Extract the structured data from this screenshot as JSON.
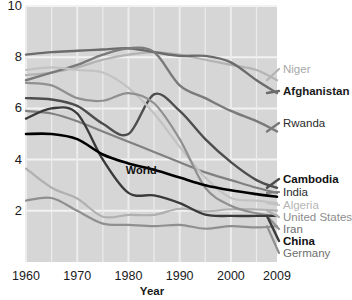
{
  "chart_data": {
    "type": "line",
    "title": "",
    "xlabel": "Year",
    "ylabel": "",
    "xlim": [
      1960,
      2009
    ],
    "ylim": [
      0,
      10
    ],
    "grid": true,
    "legend_position": "right-of-plot",
    "xticks": [
      "1960",
      "1970",
      "1980",
      "1990",
      "2000",
      "2009"
    ],
    "xtick_values": [
      1960,
      1970,
      1980,
      1990,
      2000,
      2009
    ],
    "yticks": [
      "2",
      "4",
      "6",
      "8",
      "10"
    ],
    "ytick_values": [
      2,
      4,
      6,
      8,
      10
    ],
    "x": [
      1960,
      1965,
      1970,
      1975,
      1980,
      1985,
      1990,
      1995,
      2000,
      2005,
      2009
    ],
    "annotations": [
      {
        "text": "World",
        "x": 1983,
        "y": 3.6
      }
    ],
    "series": [
      {
        "name": "Niger",
        "label": "Niger",
        "color": "#b3b3b3",
        "width": 2.2,
        "label_weight": "normal",
        "label_color": "#a8a8a8",
        "label_y": 73,
        "values": [
          7.3,
          7.4,
          7.6,
          7.9,
          8.1,
          8.2,
          8.1,
          7.9,
          7.7,
          7.5,
          7.1
        ]
      },
      {
        "name": "Afghanistan",
        "label": "Afghanistan",
        "color": "#6b6b6b",
        "width": 2.4,
        "label_weight": "bold",
        "label_color": "#1a1a1a",
        "label_y": 95,
        "values": [
          8.1,
          8.2,
          8.25,
          8.3,
          8.35,
          8.2,
          8.05,
          8.05,
          7.8,
          7.1,
          6.6
        ]
      },
      {
        "name": "Rwanda",
        "label": "Rwanda",
        "color": "#7a7a7a",
        "width": 2.4,
        "label_weight": "normal",
        "label_color": "#2a2a2a",
        "label_y": 127,
        "values": [
          7.1,
          7.4,
          7.7,
          8.1,
          8.35,
          8.2,
          6.9,
          6.4,
          5.9,
          5.5,
          5.1
        ]
      },
      {
        "name": "Cambodia",
        "label": "Cambodia",
        "color": "#4d4d4d",
        "width": 2.4,
        "label_weight": "bold",
        "label_color": "#111111",
        "label_y": 183,
        "values": [
          6.4,
          6.35,
          6.1,
          5.4,
          5.0,
          6.55,
          5.9,
          4.8,
          3.9,
          3.2,
          2.9
        ]
      },
      {
        "name": "India",
        "label": "India",
        "color": "#808080",
        "width": 2.2,
        "label_weight": "normal",
        "label_color": "#2a2a2a",
        "label_y": 196,
        "values": [
          5.9,
          5.8,
          5.5,
          5.1,
          4.7,
          4.3,
          3.9,
          3.5,
          3.2,
          2.9,
          2.7
        ]
      },
      {
        "name": "Algeria",
        "label": "Algeria",
        "color": "#c2c2c2",
        "width": 2.2,
        "label_weight": "normal",
        "label_color": "#b5b5b5",
        "label_y": 209,
        "values": [
          7.5,
          7.6,
          7.5,
          7.4,
          6.8,
          5.8,
          4.5,
          3.3,
          2.5,
          2.4,
          2.3
        ]
      },
      {
        "name": "United States",
        "label": "United States",
        "color": "#b0b0b0",
        "width": 2.2,
        "label_weight": "normal",
        "label_color": "#8d8d8d",
        "label_y": 221,
        "values": [
          3.65,
          2.9,
          2.48,
          1.77,
          1.84,
          1.84,
          2.08,
          1.98,
          2.06,
          2.05,
          2.01
        ]
      },
      {
        "name": "Iran",
        "label": "Iran",
        "color": "#909090",
        "width": 2.2,
        "label_weight": "normal",
        "label_color": "#6e6e6e",
        "label_y": 233,
        "values": [
          7.0,
          6.9,
          6.4,
          6.3,
          6.6,
          6.2,
          4.8,
          2.9,
          2.2,
          1.9,
          1.8
        ]
      },
      {
        "name": "China",
        "label": "China",
        "color": "#3a3a3a",
        "width": 2.4,
        "label_weight": "bold",
        "label_color": "#111111",
        "label_y": 245,
        "values": [
          5.6,
          6.0,
          5.8,
          4.0,
          2.7,
          2.6,
          2.3,
          1.85,
          1.8,
          1.8,
          1.8
        ]
      },
      {
        "name": "Germany",
        "label": "Germany",
        "color": "#8f8f8f",
        "width": 2.2,
        "label_weight": "normal",
        "label_color": "#6e6e6e",
        "label_y": 257,
        "values": [
          2.4,
          2.5,
          2.0,
          1.5,
          1.45,
          1.4,
          1.45,
          1.3,
          1.4,
          1.35,
          1.4
        ]
      },
      {
        "name": "World",
        "label": "World",
        "color": "#000000",
        "width": 2.6,
        "label_weight": "bold",
        "label_color": "#111111",
        "label_y": null,
        "values": [
          5.0,
          5.0,
          4.8,
          4.2,
          3.85,
          3.6,
          3.3,
          3.0,
          2.8,
          2.65,
          2.55
        ]
      }
    ]
  }
}
